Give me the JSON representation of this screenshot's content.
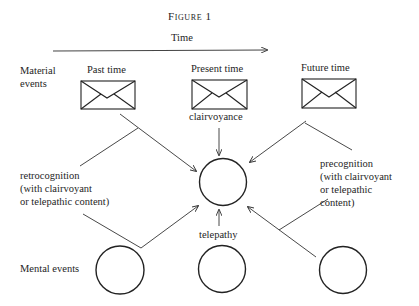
{
  "figure": {
    "title": "Figure 1",
    "time_axis_label": "Time"
  },
  "rows": {
    "material": {
      "line1": "Material",
      "line2": "events"
    },
    "mental": "Mental events"
  },
  "columns": [
    {
      "label": "Past time",
      "icon": "envelope-icon"
    },
    {
      "label": "Present time",
      "icon": "envelope-icon"
    },
    {
      "label": "Future time",
      "icon": "envelope-icon"
    }
  ],
  "connections": {
    "clairvoyance": "clairvoyance",
    "telepathy": "telepathy",
    "retrocognition": {
      "line1": "retrocognition",
      "line2": "(with clairvoyant",
      "line3": "or telepathic content)"
    },
    "precognition": {
      "line1": "precognition",
      "line2": "(with clairvoyant",
      "line3": "or telepathic",
      "line4": "content)"
    }
  },
  "colors": {
    "ink": "#1e1e1e",
    "background": "#ffffff"
  }
}
